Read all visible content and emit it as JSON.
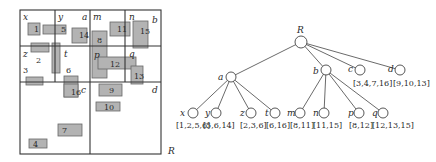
{
  "grid": {
    "outer": {
      "x": 20,
      "y": 10,
      "w": 141,
      "h": 144
    },
    "lines": [
      {
        "x1": 90,
        "y1": 10,
        "x2": 90,
        "y2": 154
      },
      {
        "x1": 20,
        "y1": 82,
        "x2": 161,
        "y2": 82
      },
      {
        "x1": 55,
        "y1": 10,
        "x2": 55,
        "y2": 82
      },
      {
        "x1": 20,
        "y1": 46,
        "x2": 90,
        "y2": 46
      },
      {
        "x1": 125,
        "y1": 10,
        "x2": 125,
        "y2": 82
      },
      {
        "x1": 90,
        "y1": 46,
        "x2": 161,
        "y2": 46
      }
    ],
    "region_labels": [
      {
        "id": "x",
        "text": "x",
        "x": 23,
        "y": 20
      },
      {
        "id": "y",
        "text": "y",
        "x": 58,
        "y": 20
      },
      {
        "id": "a",
        "text": "a",
        "x": 82,
        "y": 20
      },
      {
        "id": "m",
        "text": "m",
        "x": 93,
        "y": 20
      },
      {
        "id": "n",
        "text": "n",
        "x": 129,
        "y": 20
      },
      {
        "id": "b",
        "text": "b",
        "x": 152,
        "y": 23
      },
      {
        "id": "z",
        "text": "z",
        "x": 23,
        "y": 57
      },
      {
        "id": "t",
        "text": "t",
        "x": 64,
        "y": 57
      },
      {
        "id": "p",
        "text": "p",
        "x": 94,
        "y": 58
      },
      {
        "id": "q",
        "text": "q",
        "x": 129,
        "y": 57
      },
      {
        "id": "c",
        "text": "c",
        "x": 81,
        "y": 93
      },
      {
        "id": "d",
        "text": "d",
        "x": 152,
        "y": 93
      },
      {
        "id": "R",
        "text": "R",
        "x": 168,
        "y": 154
      }
    ],
    "rectangles": [
      {
        "id": "1",
        "x": 28,
        "y": 23,
        "w": 12,
        "h": 12,
        "lx": 34,
        "ly": 32
      },
      {
        "id": "5",
        "x": 43,
        "y": 25,
        "w": 23,
        "h": 9,
        "lx": 61,
        "ly": 32
      },
      {
        "id": "14",
        "x": 72,
        "y": 28,
        "w": 15,
        "h": 15,
        "lx": 79,
        "ly": 38
      },
      {
        "id": "2",
        "x": 31,
        "y": 43,
        "w": 18,
        "h": 9,
        "lx": 36,
        "ly": 63
      },
      {
        "id": "t-bar",
        "x": 52,
        "y": 43,
        "w": 8,
        "h": 30,
        "lx": -100,
        "ly": -100
      },
      {
        "id": "3",
        "x": 26,
        "y": 77,
        "w": 17,
        "h": 8,
        "lx": 23,
        "ly": 73
      },
      {
        "id": "6",
        "x": 64,
        "y": 76,
        "w": 14,
        "h": 21,
        "lx": 66,
        "ly": 73
      },
      {
        "id": "16",
        "x": 64,
        "y": 84,
        "w": 14,
        "h": 13,
        "lx": 71,
        "ly": 95
      },
      {
        "id": "11",
        "x": 110,
        "y": 22,
        "w": 20,
        "h": 14,
        "lx": 117,
        "ly": 32
      },
      {
        "id": "15",
        "x": 133,
        "y": 21,
        "w": 15,
        "h": 27,
        "lx": 140,
        "ly": 34
      },
      {
        "id": "8",
        "x": 92,
        "y": 31,
        "w": 15,
        "h": 47,
        "lx": 97,
        "ly": 43
      },
      {
        "id": "12",
        "x": 98,
        "y": 57,
        "w": 38,
        "h": 12,
        "lx": 110,
        "ly": 67
      },
      {
        "id": "13",
        "x": 131,
        "y": 66,
        "w": 12,
        "h": 18,
        "lx": 134,
        "ly": 79
      },
      {
        "id": "9",
        "x": 99,
        "y": 84,
        "w": 23,
        "h": 12,
        "lx": 109,
        "ly": 93
      },
      {
        "id": "10",
        "x": 96,
        "y": 102,
        "w": 24,
        "h": 9,
        "lx": 104,
        "ly": 110
      },
      {
        "id": "7",
        "x": 58,
        "y": 124,
        "w": 24,
        "h": 12,
        "lx": 62,
        "ly": 133
      },
      {
        "id": "4",
        "x": 29,
        "y": 139,
        "w": 18,
        "h": 9,
        "lx": 33,
        "ly": 147
      }
    ]
  },
  "tree": {
    "nodes": [
      {
        "id": "R",
        "label": "R",
        "cx": 301,
        "cy": 42,
        "lx": 297,
        "ly": 33,
        "set": ""
      },
      {
        "id": "a",
        "label": "a",
        "cx": 231,
        "cy": 77,
        "lx": 218,
        "ly": 80,
        "set": ""
      },
      {
        "id": "b",
        "label": "b",
        "cx": 326,
        "cy": 70,
        "lx": 313,
        "ly": 74,
        "set": ""
      },
      {
        "id": "c",
        "label": "c",
        "cx": 360,
        "cy": 70,
        "lx": 348,
        "ly": 72,
        "set": "[3,4,7,16]",
        "sx": 353,
        "sy": 86
      },
      {
        "id": "d",
        "label": "d",
        "cx": 400,
        "cy": 70,
        "lx": 388,
        "ly": 72,
        "set": "[9,10,13]",
        "sx": 393,
        "sy": 86
      },
      {
        "id": "x",
        "label": "x",
        "cx": 193,
        "cy": 113,
        "lx": 180,
        "ly": 116,
        "set": "[1,2,5,6]",
        "sx": 176,
        "sy": 128
      },
      {
        "id": "y",
        "label": "y",
        "cx": 216,
        "cy": 113,
        "lx": 205,
        "ly": 116,
        "set": "[5,6,14]",
        "sx": 203,
        "sy": 128
      },
      {
        "id": "z",
        "label": "z",
        "cx": 251,
        "cy": 113,
        "lx": 240,
        "ly": 116,
        "set": "[2,3,6]",
        "sx": 240,
        "sy": 128
      },
      {
        "id": "t",
        "label": "t",
        "cx": 275,
        "cy": 113,
        "lx": 265,
        "ly": 116,
        "set": "[6,16]",
        "sx": 266,
        "sy": 128
      },
      {
        "id": "m",
        "label": "m",
        "cx": 300,
        "cy": 113,
        "lx": 287,
        "ly": 116,
        "set": "[8,11]",
        "sx": 290,
        "sy": 128
      },
      {
        "id": "n",
        "label": "n",
        "cx": 324,
        "cy": 113,
        "lx": 313,
        "ly": 116,
        "set": "[11,15]",
        "sx": 313,
        "sy": 128
      },
      {
        "id": "p",
        "label": "p",
        "cx": 359,
        "cy": 113,
        "lx": 348,
        "ly": 116,
        "set": "[8,12]",
        "sx": 349,
        "sy": 128
      },
      {
        "id": "q",
        "label": "q",
        "cx": 383,
        "cy": 113,
        "lx": 372,
        "ly": 116,
        "set": "[12,13,15]",
        "sx": 372,
        "sy": 128
      }
    ],
    "edges": [
      [
        "R",
        "a"
      ],
      [
        "R",
        "b"
      ],
      [
        "R",
        "c"
      ],
      [
        "R",
        "d"
      ],
      [
        "a",
        "x"
      ],
      [
        "a",
        "y"
      ],
      [
        "a",
        "z"
      ],
      [
        "a",
        "t"
      ],
      [
        "b",
        "m"
      ],
      [
        "b",
        "n"
      ],
      [
        "b",
        "p"
      ],
      [
        "b",
        "q"
      ]
    ]
  }
}
